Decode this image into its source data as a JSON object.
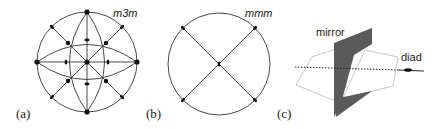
{
  "panels": [
    {
      "label": "(a)",
      "symbol": "m3m"
    },
    {
      "label": "(b)",
      "symbol": "mmm"
    },
    {
      "label": "(c)",
      "annotations": {
        "mirror": "mirror",
        "diad": "diad"
      }
    }
  ],
  "colors": {
    "line": "#333333",
    "mirror_fill": "#5a5a5a",
    "hexagon": "#c8c8c8"
  }
}
